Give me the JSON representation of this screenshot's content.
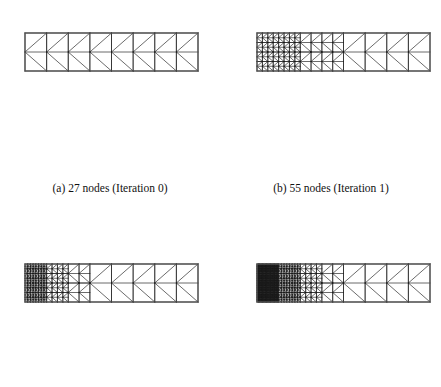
{
  "figure": {
    "background_color": "#ffffff",
    "line_color": "#1a1a1a",
    "border_color": "#555555",
    "panel_count": 4
  },
  "captions": {
    "a": "(a) 27 nodes (Iteration 0)",
    "b": "(b) 55 nodes (Iteration 1)",
    "c": "",
    "d": ""
  },
  "panels": [
    {
      "id": "a",
      "label": "(a) 27 nodes (Iteration 0)",
      "node_count": 27,
      "iteration": 0,
      "columns": 8,
      "refined_columns": 0,
      "refine_levels": 0,
      "box": {
        "x": 25,
        "y": 33,
        "width": 173,
        "height": 38
      }
    },
    {
      "id": "b",
      "label": "(b) 55 nodes (Iteration 1)",
      "node_count": 55,
      "iteration": 1,
      "columns": 8,
      "refined_columns": 4,
      "refine_levels": 2,
      "box": {
        "x": 257,
        "y": 33,
        "width": 173,
        "height": 38
      }
    },
    {
      "id": "c",
      "label": "",
      "node_count": null,
      "iteration": 2,
      "columns": 8,
      "refined_columns": 3,
      "refine_levels": 3,
      "box": {
        "x": 25,
        "y": 264,
        "width": 173,
        "height": 38
      }
    },
    {
      "id": "d",
      "label": "",
      "node_count": null,
      "iteration": 3,
      "columns": 8,
      "refined_columns": 4,
      "refine_levels": 4,
      "box": {
        "x": 257,
        "y": 264,
        "width": 173,
        "height": 38
      }
    }
  ],
  "chart_data": {
    "type": "diagram",
    "subtype": "finite-element-mesh",
    "element_type": "triangle",
    "domain": {
      "length_units": 8,
      "height_units": 2,
      "aspect_ratio": 4.55
    },
    "series": [
      {
        "name": "Iteration 0",
        "nodes": 27,
        "panel": "a",
        "refinement_zone_fraction": 0.0
      },
      {
        "name": "Iteration 1",
        "nodes": 55,
        "panel": "b",
        "refinement_zone_fraction": 0.45
      },
      {
        "name": "Iteration 2",
        "nodes": null,
        "panel": "c",
        "refinement_zone_fraction": 0.38
      },
      {
        "name": "Iteration 3",
        "nodes": null,
        "panel": "d",
        "refinement_zone_fraction": 0.5
      }
    ],
    "categories": [
      "Iteration 0",
      "Iteration 1",
      "Iteration 2",
      "Iteration 3"
    ],
    "values": [
      27,
      55,
      null,
      null
    ],
    "xlabel": "",
    "ylabel": "Number of nodes",
    "legend": "none",
    "grid": false
  }
}
